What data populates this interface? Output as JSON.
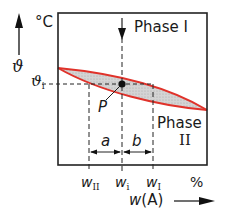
{
  "diagram": {
    "type": "two-phase-region-lever-rule",
    "y_axis": {
      "symbol": "ϑ",
      "unit": "°C",
      "marked_value": {
        "symbol": "ϑ",
        "subscript": "i"
      }
    },
    "x_axis": {
      "symbol": "w(A)",
      "unit": "%",
      "marks": [
        {
          "symbol": "w",
          "subscript": "II"
        },
        {
          "symbol": "w",
          "subscript": "i"
        },
        {
          "symbol": "w",
          "subscript": "I"
        }
      ]
    },
    "regions": {
      "upper": {
        "line1": "Phase I"
      },
      "lower": {
        "line1": "Phase",
        "line2": "II"
      }
    },
    "point": {
      "label": "P"
    },
    "segments": {
      "left": "a",
      "right": "b"
    },
    "colors": {
      "curve": "#e0322a",
      "lens_fill": "#cfcfcf",
      "frame": "#222222"
    }
  }
}
